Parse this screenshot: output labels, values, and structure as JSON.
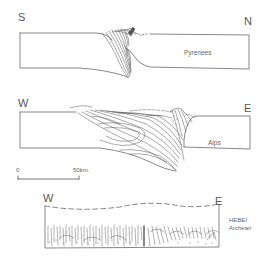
{
  "sections": [
    {
      "id": "pyrenees",
      "name": "Pyrenees",
      "left_direction": "S",
      "right_direction": "N"
    },
    {
      "id": "alps",
      "name": "Alps",
      "left_direction": "W",
      "right_direction": "E"
    },
    {
      "id": "hebei",
      "name": "HEBEI",
      "subtitle": "Archean",
      "left_direction": "W",
      "right_direction": "E"
    }
  ],
  "scale_bar": {
    "start_label": "0",
    "end_label": "50km."
  },
  "colors": {
    "line": "#555555",
    "background": "#ffffff"
  }
}
